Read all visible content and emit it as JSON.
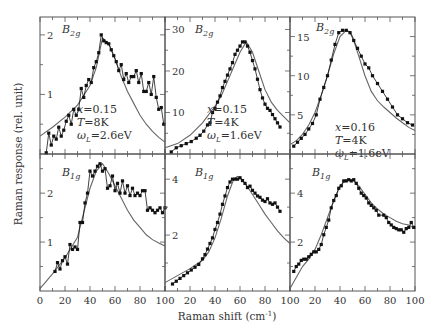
{
  "chart_data": {
    "type": "line",
    "xlabel": "Raman shift (cm-1)",
    "xlabel_parts": {
      "main": "Raman shift (cm",
      "sup": "-1",
      "close": ")"
    },
    "ylabel": "Raman response (rel. unit)",
    "x_ticks": [
      0,
      20,
      40,
      60,
      80,
      100
    ],
    "layout": "2x3 grid of panels sharing x axis 0-100",
    "legend": "filled squares = experimental data; solid line = theory",
    "panels": [
      {
        "id": "top-left",
        "symmetry": "B2g",
        "sym_main": "B",
        "sym_sub": "2g",
        "params": [
          "x=0.15",
          "T=8K",
          "ωL=2.6eV"
        ],
        "param_parts": [
          {
            "v": "x",
            "r": "=0.15"
          },
          {
            "v": "T",
            "r": "=8K"
          },
          {
            "v": "ω",
            "sub": "L",
            "r": "=2.6eV"
          }
        ],
        "ylim": [
          0,
          2.3
        ],
        "yticks": [
          1,
          2
        ],
        "data_x": [
          5,
          7,
          9,
          11,
          13,
          15,
          17,
          19,
          21,
          23,
          25,
          27,
          29,
          31,
          33,
          35,
          37,
          39,
          41,
          43,
          45,
          47,
          49,
          51,
          53,
          55,
          57,
          59,
          61,
          63,
          65,
          67,
          69,
          71,
          73,
          75,
          77,
          79,
          81,
          83,
          85,
          87,
          89,
          91,
          93,
          95,
          97,
          99
        ],
        "data_y": [
          0.02,
          0.35,
          0.15,
          0.3,
          0.25,
          0.45,
          0.3,
          0.4,
          0.55,
          0.65,
          0.5,
          0.75,
          0.65,
          0.75,
          1.1,
          0.95,
          1.15,
          1.25,
          1.2,
          1.45,
          1.55,
          1.7,
          2.0,
          1.9,
          1.87,
          1.85,
          1.75,
          1.65,
          1.55,
          1.4,
          1.5,
          1.25,
          1.35,
          1.2,
          1.3,
          1.3,
          1.4,
          1.2,
          1.35,
          1.05,
          1.05,
          1.2,
          1.0,
          1.3,
          0.95,
          0.75,
          0.78,
          0.5
        ],
        "fit_x": [
          0,
          10,
          20,
          30,
          40,
          45,
          50,
          55,
          60,
          65,
          70,
          75,
          80,
          85,
          90,
          95,
          100
        ],
        "fit_y": [
          0.3,
          0.45,
          0.62,
          0.82,
          1.15,
          1.45,
          1.95,
          1.85,
          1.6,
          1.3,
          1.05,
          0.85,
          0.65,
          0.5,
          0.38,
          0.28,
          0.2
        ]
      },
      {
        "id": "top-middle",
        "symmetry": "B2g",
        "sym_main": "B",
        "sym_sub": "2g",
        "params": [
          "x=0.15",
          "T=4K",
          "ωL=1.6eV"
        ],
        "param_parts": [
          {
            "v": "x",
            "r": "=0.15"
          },
          {
            "v": "T",
            "r": "=4K"
          },
          {
            "v": "ω",
            "sub": "L",
            "r": "=1.6eV"
          }
        ],
        "ylim": [
          0,
          33
        ],
        "yticks": [
          10,
          20,
          30
        ],
        "data_x": [
          5,
          9,
          13,
          17,
          21,
          25,
          28,
          31,
          34,
          36,
          38,
          40,
          42,
          44,
          46,
          48,
          50,
          52,
          54,
          56,
          58,
          60,
          62,
          64,
          66,
          68,
          70,
          72,
          74,
          76,
          78,
          80,
          82,
          84,
          86,
          88,
          90,
          92
        ],
        "data_y": [
          0.5,
          1.5,
          2,
          2.5,
          3,
          3.8,
          4.5,
          5.5,
          7,
          7.5,
          10,
          11,
          12.5,
          14,
          16,
          17.5,
          19,
          20.5,
          22,
          24,
          25,
          26,
          27,
          27,
          26,
          24.5,
          22.5,
          20.5,
          18,
          15.5,
          13.5,
          12,
          11,
          10.5,
          9.5,
          8.5,
          7.5,
          6.5
        ],
        "fit_x": [
          0,
          10,
          20,
          30,
          40,
          45,
          50,
          55,
          60,
          65,
          70,
          75,
          80,
          85,
          90,
          95,
          100
        ],
        "fit_y": [
          1.5,
          2.5,
          4.5,
          7.5,
          11.5,
          14,
          17.5,
          21,
          24.5,
          27,
          24.5,
          20,
          15.5,
          12.5,
          10.5,
          9,
          7.5
        ]
      },
      {
        "id": "top-right",
        "symmetry": "B2g",
        "sym_main": "B",
        "sym_sub": "2g",
        "params": [
          "x=0.16",
          "T=4K",
          "ωL=1.6eV"
        ],
        "param_parts": [
          {
            "v": "x",
            "r": "=0.16"
          },
          {
            "v": "T",
            "r": "=4K"
          },
          {
            "v": "ω",
            "sub": "L",
            "r": "=1.6eV"
          }
        ],
        "ylim": [
          0,
          17.5
        ],
        "yticks": [
          5,
          10,
          15
        ],
        "data_x": [
          3,
          6,
          9,
          12,
          15,
          18,
          21,
          24,
          27,
          30,
          33,
          36,
          39,
          42,
          45,
          48,
          51,
          54,
          57,
          60,
          63,
          66,
          70,
          74,
          78,
          82,
          86,
          90,
          94,
          98
        ],
        "data_y": [
          1,
          1.5,
          2,
          2.5,
          3.2,
          3.9,
          5,
          7,
          8.5,
          10,
          12,
          14,
          15.5,
          15.8,
          15.8,
          15.5,
          14.5,
          13.5,
          12.5,
          11.5,
          11,
          10,
          9,
          8,
          7,
          6,
          5,
          4.5,
          4,
          3.7
        ],
        "fit_x": [
          0,
          5,
          10,
          15,
          20,
          25,
          30,
          35,
          40,
          45,
          48,
          50,
          55,
          60,
          65,
          70,
          75,
          80,
          85,
          90,
          95,
          100
        ],
        "fit_y": [
          1.2,
          1.7,
          2.5,
          3.7,
          5.3,
          7.5,
          10,
          12.8,
          15,
          15.8,
          15.6,
          15,
          12.5,
          10,
          8,
          6.8,
          6,
          5.3,
          4.6,
          4,
          3.4,
          3
        ]
      },
      {
        "id": "bottom-left",
        "symmetry": "B1g",
        "sym_main": "B",
        "sym_sub": "1g",
        "params": [],
        "ylim": [
          0,
          2.8
        ],
        "yticks": [
          1,
          2
        ],
        "data_x": [
          12,
          14,
          16,
          18,
          20,
          22,
          24,
          26,
          28,
          30,
          32,
          34,
          36,
          38,
          40,
          42,
          44,
          46,
          48,
          50,
          52,
          54,
          56,
          58,
          60,
          62,
          64,
          66,
          68,
          70,
          72,
          74,
          76,
          78,
          80,
          82,
          84,
          86,
          88,
          90,
          92,
          94,
          96,
          98,
          100
        ],
        "data_y": [
          0.4,
          0.58,
          0.45,
          0.62,
          0.7,
          0.55,
          0.95,
          0.85,
          0.9,
          0.85,
          1.4,
          1.4,
          1.8,
          2.0,
          2.45,
          2.35,
          2.45,
          2.55,
          2.6,
          2.45,
          2.5,
          2.1,
          2.15,
          2.35,
          2.05,
          2.2,
          2.0,
          2.25,
          2.0,
          2.15,
          1.95,
          2.1,
          1.95,
          2.0,
          1.95,
          2.05,
          2.05,
          1.65,
          1.7,
          1.65,
          1.6,
          1.65,
          1.7,
          1.6,
          1.7
        ],
        "fit_x": [
          0,
          10,
          20,
          30,
          35,
          40,
          45,
          50,
          55,
          60,
          65,
          70,
          75,
          80,
          85,
          90,
          95,
          100
        ],
        "fit_y": [
          0.05,
          0.35,
          0.68,
          1.1,
          1.6,
          2.1,
          2.45,
          2.6,
          2.4,
          2.15,
          1.9,
          1.65,
          1.45,
          1.3,
          1.15,
          1.05,
          0.98,
          0.92
        ]
      },
      {
        "id": "bottom-middle",
        "symmetry": "B1g",
        "sym_main": "B",
        "sym_sub": "1g",
        "params": [],
        "ylim": [
          0,
          4.9
        ],
        "yticks": [
          2,
          4
        ],
        "data_x": [
          6,
          9,
          12,
          15,
          18,
          21,
          24,
          27,
          30,
          32,
          34,
          36,
          38,
          40,
          42,
          44,
          46,
          48,
          50,
          52,
          54,
          56,
          58,
          60,
          62,
          64,
          66,
          68,
          70,
          72,
          74,
          76,
          78,
          80,
          82,
          84,
          86,
          88,
          90,
          92
        ],
        "data_y": [
          0.25,
          0.35,
          0.45,
          0.55,
          0.65,
          0.75,
          0.85,
          0.95,
          1.15,
          1.3,
          1.5,
          1.7,
          1.9,
          2.2,
          2.45,
          2.75,
          3.1,
          3.4,
          3.7,
          3.9,
          4.0,
          4.0,
          4.0,
          4.05,
          3.95,
          3.85,
          3.7,
          3.75,
          3.6,
          3.5,
          3.4,
          3.35,
          3.25,
          3.2,
          3.3,
          3.15,
          3.1,
          3.15,
          3.0,
          2.85
        ],
        "fit_x": [
          0,
          10,
          20,
          30,
          35,
          40,
          45,
          50,
          55,
          58,
          60,
          65,
          70,
          75,
          80,
          85,
          90,
          95,
          100
        ],
        "fit_y": [
          0.3,
          0.55,
          0.8,
          1.1,
          1.4,
          1.9,
          2.6,
          3.4,
          4.0,
          4.1,
          4.05,
          3.8,
          3.45,
          3.1,
          2.75,
          2.45,
          2.15,
          1.9,
          1.7
        ]
      },
      {
        "id": "bottom-right",
        "symmetry": "B1g",
        "sym_main": "B",
        "sym_sub": "1g",
        "params": [],
        "ylim": [
          0,
          5.6
        ],
        "yticks": [
          2,
          4
        ],
        "data_x": [
          3,
          5,
          7,
          9,
          11,
          13,
          15,
          17,
          19,
          21,
          23,
          25,
          27,
          29,
          31,
          33,
          35,
          37,
          39,
          41,
          43,
          45,
          47,
          49,
          51,
          53,
          55,
          57,
          59,
          61,
          63,
          65,
          67,
          69,
          71,
          75,
          77,
          79,
          81,
          83,
          85,
          87,
          89,
          91,
          93,
          95,
          97,
          99
        ],
        "data_y": [
          0.8,
          1.0,
          1.1,
          1.25,
          1.3,
          1.3,
          1.4,
          1.5,
          1.6,
          1.6,
          1.7,
          1.9,
          2.3,
          2.6,
          2.9,
          3.4,
          3.7,
          3.9,
          4.2,
          4.3,
          4.5,
          4.5,
          4.55,
          4.5,
          4.55,
          4.4,
          4.2,
          4.0,
          3.9,
          3.8,
          3.6,
          3.5,
          3.4,
          3.3,
          3.1,
          3.1,
          3.0,
          2.8,
          2.7,
          2.6,
          2.55,
          2.5,
          2.5,
          2.4,
          2.55,
          2.6,
          2.8,
          2.6
        ],
        "fit_x": [
          0,
          5,
          10,
          15,
          20,
          25,
          30,
          35,
          40,
          45,
          50,
          55,
          60,
          65,
          70,
          75,
          80,
          85,
          90,
          95,
          100
        ],
        "fit_y": [
          0.1,
          0.55,
          1.0,
          1.3,
          1.7,
          2.3,
          3.0,
          3.7,
          4.3,
          4.55,
          4.55,
          4.3,
          3.95,
          3.6,
          3.35,
          3.15,
          3.0,
          2.85,
          2.75,
          2.7,
          2.55
        ]
      }
    ]
  }
}
